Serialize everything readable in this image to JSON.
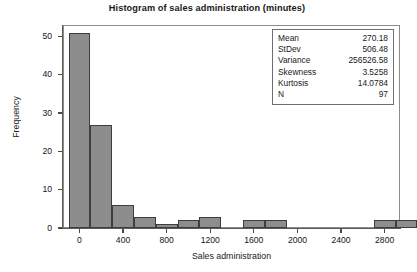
{
  "chart_data": {
    "type": "bar",
    "title": "Histogram of sales administration (minutes)",
    "xlabel": "Sales administration",
    "ylabel": "Frequency",
    "xlim": [
      -160,
      2950
    ],
    "ylim": [
      0,
      53
    ],
    "grid": false,
    "legend_position": "none",
    "bin_width": 200,
    "bin_starts": [
      -100,
      100,
      300,
      500,
      700,
      900,
      1100,
      1300,
      1500,
      1700,
      1900,
      2100,
      2300,
      2500,
      2700,
      2900
    ],
    "bin_centers": [
      0,
      200,
      400,
      600,
      800,
      1000,
      1200,
      1400,
      1600,
      1800,
      2000,
      2200,
      2400,
      2600,
      2800,
      3000
    ],
    "values": [
      51,
      27,
      6,
      3,
      1,
      2,
      3,
      0,
      2,
      2,
      0,
      0,
      0,
      0,
      2,
      2
    ],
    "xticks": [
      0,
      400,
      800,
      1200,
      1600,
      2000,
      2400,
      2800
    ],
    "xtick_labels": [
      "0",
      "400",
      "800",
      "1200",
      "1600",
      "2000",
      "2400",
      "2800"
    ],
    "yticks": [
      0,
      10,
      20,
      30,
      40,
      50
    ],
    "ytick_labels": [
      "0",
      "10",
      "20",
      "30",
      "40",
      "50"
    ],
    "bar_fill_color": "#8d8d8d",
    "bar_edge_color": "#3e3e3e"
  },
  "stats_box": {
    "rows": [
      {
        "label": "Mean",
        "value": "270.18"
      },
      {
        "label": "StDev",
        "value": "506.48"
      },
      {
        "label": "Variance",
        "value": "256526.58"
      },
      {
        "label": "Skewness",
        "value": "3.5258"
      },
      {
        "label": "Kurtosis",
        "value": "14.0784"
      },
      {
        "label": "N",
        "value": "97"
      }
    ]
  }
}
